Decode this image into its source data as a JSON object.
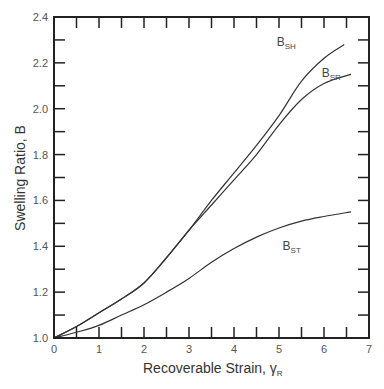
{
  "chart_data": {
    "type": "line",
    "title": "",
    "xlabel": "Recoverable Strain, γR",
    "xlabel_main": "Recoverable Strain, γ",
    "xlabel_sub": "R",
    "ylabel": "Swelling Ratio, B",
    "xlim": [
      0,
      7
    ],
    "ylim": [
      1.0,
      2.4
    ],
    "x_ticks": [
      0,
      1,
      2,
      3,
      4,
      5,
      6,
      7
    ],
    "x_tick_labels": [
      "0",
      "1",
      "2",
      "3",
      "4",
      "5",
      "6",
      "7"
    ],
    "y_ticks": [
      1.0,
      1.2,
      1.4,
      1.6,
      1.8,
      2.0,
      2.2,
      2.4
    ],
    "y_tick_labels": [
      "1.0",
      "1.2",
      "1.4",
      "1.6",
      "1.8",
      "2.0",
      "2.2",
      "2.4"
    ],
    "minor_ticks": {
      "x_step": 0.5,
      "y_step": 0.1
    },
    "grid": false,
    "legend": "inline labels",
    "series": [
      {
        "name": "BSH",
        "label_main": "B",
        "label_sub": "SH",
        "label_pos": [
          4.95,
          2.275
        ],
        "x": [
          0,
          0.5,
          1,
          1.5,
          2,
          2.5,
          3,
          3.5,
          4,
          4.5,
          5,
          5.5,
          6,
          6.45
        ],
        "y": [
          1.0,
          1.05,
          1.11,
          1.17,
          1.24,
          1.35,
          1.47,
          1.6,
          1.72,
          1.84,
          1.97,
          2.12,
          2.22,
          2.28
        ]
      },
      {
        "name": "BSR",
        "label_main": "B",
        "label_sub": "SR",
        "label_pos": [
          5.95,
          2.14
        ],
        "x": [
          0,
          0.5,
          1,
          1.5,
          2,
          2.5,
          3,
          3.5,
          4,
          4.5,
          5,
          5.5,
          6,
          6.6
        ],
        "y": [
          1.0,
          1.05,
          1.11,
          1.17,
          1.24,
          1.35,
          1.47,
          1.58,
          1.69,
          1.8,
          1.93,
          2.04,
          2.11,
          2.15
        ]
      },
      {
        "name": "BST",
        "label_main": "B",
        "label_sub": "ST",
        "label_pos": [
          5.08,
          1.385
        ],
        "x": [
          0,
          0.5,
          1,
          1.5,
          2,
          2.5,
          3,
          3.5,
          4,
          4.5,
          5,
          5.5,
          6,
          6.6
        ],
        "y": [
          1.0,
          1.025,
          1.055,
          1.1,
          1.145,
          1.2,
          1.26,
          1.33,
          1.39,
          1.44,
          1.48,
          1.51,
          1.53,
          1.55
        ]
      }
    ]
  },
  "colors": {
    "axis": "#222222",
    "curve": "#333333",
    "text": "#444444"
  }
}
